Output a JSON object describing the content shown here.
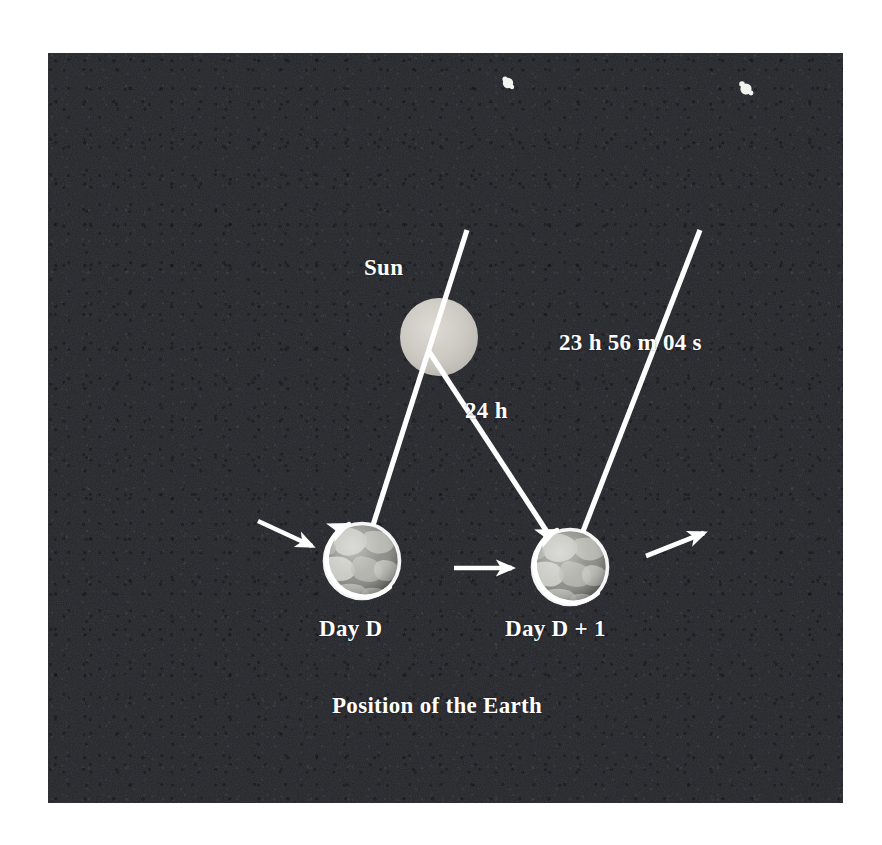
{
  "figure": {
    "caption": "Position of the Earth",
    "background_color": "#24252a",
    "foreground_color": "#ffffff"
  },
  "labels": {
    "sun": "Sun",
    "solar_day": "24 h",
    "sidereal_day": "23 h 56 m 04 s",
    "earth_first": "Day D",
    "earth_second": "Day D + 1"
  },
  "bodies": {
    "sun": {
      "name": "Sun",
      "cx": 439,
      "cy": 337,
      "r": 39,
      "color": "#c8c8c4"
    },
    "earths": [
      {
        "name": "Day D",
        "cx": 362,
        "cy": 561,
        "r": 38
      },
      {
        "name": "Day D + 1",
        "cx": 570,
        "cy": 567,
        "r": 38
      }
    ]
  },
  "stars": [
    {
      "x": 508,
      "y": 83,
      "r": 5
    },
    {
      "x": 746,
      "y": 89,
      "r": 5
    }
  ],
  "sight_lines": [
    {
      "name": "meridian-line-day-d",
      "note": "reference star direction through Earth on Day D",
      "x1": 467,
      "y1": 230,
      "x2": 362,
      "y2": 561
    },
    {
      "name": "solar-line-24h",
      "note": "Sun to Earth on Day D + 1, one solar day later",
      "x1": 430,
      "y1": 353,
      "x2": 570,
      "y2": 567
    },
    {
      "name": "sidereal-line-23h56m",
      "note": "reference star direction through Earth on Day D + 1",
      "x1": 700,
      "y1": 230,
      "x2": 570,
      "y2": 567
    }
  ],
  "motion_arrows": [
    {
      "name": "orbit-arrow-incoming",
      "x1": 258,
      "y1": 521,
      "x2": 317,
      "y2": 548
    },
    {
      "name": "orbit-arrow-between",
      "x1": 454,
      "y1": 568,
      "x2": 518,
      "y2": 568
    },
    {
      "name": "orbit-arrow-outgoing",
      "x1": 646,
      "y1": 556,
      "x2": 709,
      "y2": 531
    }
  ],
  "rotation_arcs": [
    {
      "name": "rotation-arc-day-d",
      "cx": 362,
      "cy": 561,
      "r": 38
    },
    {
      "name": "rotation-arc-day-d1",
      "cx": 570,
      "cy": 567,
      "r": 38
    }
  ]
}
